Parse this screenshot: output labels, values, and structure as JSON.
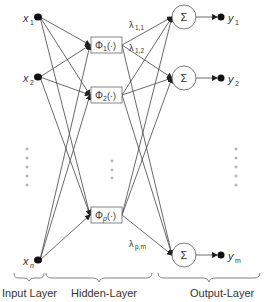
{
  "diagram": {
    "type": "RBF neural network",
    "colors": {
      "stroke": "#444444",
      "text": "#333333",
      "node": "#111111",
      "dots": "#888888",
      "background": "#ffffff"
    },
    "input_layer": {
      "label": "Input Layer",
      "nodes": [
        {
          "var": "x",
          "sub": "1"
        },
        {
          "var": "x",
          "sub": "2"
        },
        {
          "var": "x",
          "sub": "n"
        }
      ]
    },
    "hidden_layer": {
      "label": "Hidden-Layer",
      "nodes": [
        {
          "func": "Φ",
          "sub": "1",
          "arg": "(·)"
        },
        {
          "func": "Φ",
          "sub": "2",
          "arg": "(·)"
        },
        {
          "func": "Φ",
          "sub": "p",
          "arg": "(·)"
        }
      ]
    },
    "output_layer": {
      "label": "Output-Layer",
      "nodes": [
        {
          "op": "Σ",
          "out_var": "y",
          "out_sub": "1"
        },
        {
          "op": "Σ",
          "out_var": "y",
          "out_sub": "2"
        },
        {
          "op": "Σ",
          "out_var": "y",
          "out_sub": "m"
        }
      ]
    },
    "weights": [
      {
        "sym": "λ",
        "sub": "1,1"
      },
      {
        "sym": "λ",
        "sub": "1,2"
      },
      {
        "sym": "λ",
        "sub": "p,m"
      }
    ]
  }
}
